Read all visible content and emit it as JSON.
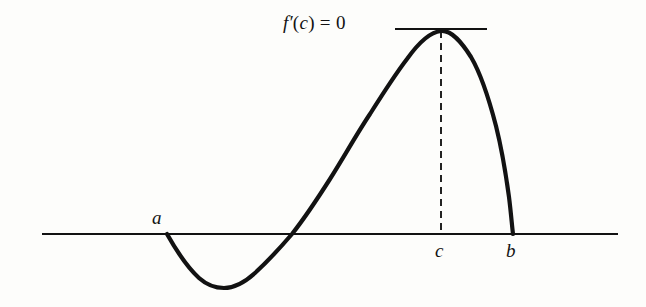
{
  "figure": {
    "background_color": "#fdfdfb",
    "ink_color": "#121212"
  },
  "labels": {
    "tangent": {
      "f": "f",
      "prime": "′",
      "open_paren": "(",
      "c": "c",
      "close_paren": ")",
      "equals": " = 0",
      "full_text": "f′(c) = 0"
    },
    "point_a": "a",
    "point_b": "b",
    "point_c": "c"
  },
  "chart_data": {
    "type": "line",
    "title": "f′(c) = 0",
    "xlabel": "",
    "ylabel": "",
    "grid": false,
    "legend": null,
    "axis": {
      "x_axis_y_px": 234,
      "x_axis_start_px": 42,
      "x_axis_end_px": 618,
      "stroke_width": 2
    },
    "annotations": [
      {
        "name": "point-a",
        "label": "a",
        "x_px": 167,
        "y_px": 234,
        "label_x_px": 152,
        "label_y_px": 208,
        "description": "left endpoint of curve on the x-axis"
      },
      {
        "name": "point-c",
        "label": "c",
        "x_px": 441,
        "y_px": 234,
        "label_x_px": 435,
        "label_y_px": 241,
        "description": "interior point where derivative is zero"
      },
      {
        "name": "point-b",
        "label": "b",
        "x_px": 513,
        "y_px": 234,
        "label_x_px": 506,
        "label_y_px": 241,
        "description": "right endpoint of curve on the x-axis"
      }
    ],
    "tangent_line": {
      "x_start_px": 395,
      "x_end_px": 487,
      "y_px": 29,
      "slope": 0,
      "stroke_width": 2
    },
    "dashed_line": {
      "x_px": 441,
      "y_start_px": 31,
      "y_end_px": 234,
      "dash_pattern": "7 5",
      "stroke_width": 2
    },
    "curve": {
      "stroke_width": 4.2,
      "peak": {
        "x_px": 441,
        "y_px": 31
      },
      "trough": {
        "x_px": 224,
        "y_px": 288
      },
      "zero_crossings_px": [
        167,
        292,
        513
      ],
      "points_px": [
        [
          167,
          234
        ],
        [
          180,
          256
        ],
        [
          192,
          271
        ],
        [
          205,
          282
        ],
        [
          224,
          288
        ],
        [
          243,
          283
        ],
        [
          259,
          271
        ],
        [
          274,
          255
        ],
        [
          292,
          234
        ],
        [
          310,
          209
        ],
        [
          330,
          179
        ],
        [
          350,
          146
        ],
        [
          368,
          117
        ],
        [
          385,
          90
        ],
        [
          400,
          68
        ],
        [
          414,
          50
        ],
        [
          427,
          37
        ],
        [
          441,
          31
        ],
        [
          455,
          34
        ],
        [
          468,
          47
        ],
        [
          480,
          69
        ],
        [
          490,
          98
        ],
        [
          498,
          131
        ],
        [
          504,
          166
        ],
        [
          508,
          197
        ],
        [
          511,
          220
        ],
        [
          513,
          234
        ]
      ]
    }
  }
}
